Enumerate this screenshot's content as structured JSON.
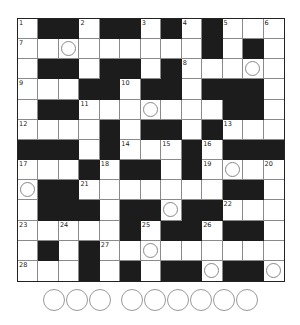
{
  "puzzle": {
    "size": {
      "rows": 13,
      "cols": 13
    },
    "grid": [
      "W#BBW#BBW#BW#BW#WW",
      "x"
    ],
    "rows": [
      "WBBWBBWBWBWWW",
      "WWWWWWWWWBWBW",
      "WBBWBBWBWWWWW",
      "WWWBBWBBWBBBW",
      "WBBWWWWWWWBBW",
      "WWWWBWBBWBWWW",
      "BBBWBWWWBWBBB",
      "WWWBWBBWBWWWW",
      "WBBWWWWWWWBBW",
      "WBBBWBBWBBWWW",
      "WWWWWBWBBWBBW",
      "WBWBWWWWWWWWW",
      "WWWBWBWBBWBBW"
    ],
    "numbers": [
      {
        "r": 0,
        "c": 0,
        "n": "1"
      },
      {
        "r": 0,
        "c": 3,
        "n": "2"
      },
      {
        "r": 0,
        "c": 6,
        "n": "3"
      },
      {
        "r": 0,
        "c": 8,
        "n": "4"
      },
      {
        "r": 0,
        "c": 10,
        "n": "5"
      },
      {
        "r": 0,
        "c": 12,
        "n": "6"
      },
      {
        "r": 1,
        "c": 0,
        "n": "7"
      },
      {
        "r": 2,
        "c": 8,
        "n": "8"
      },
      {
        "r": 3,
        "c": 0,
        "n": "9"
      },
      {
        "r": 3,
        "c": 5,
        "n": "10"
      },
      {
        "r": 4,
        "c": 3,
        "n": "11"
      },
      {
        "r": 5,
        "c": 0,
        "n": "12"
      },
      {
        "r": 5,
        "c": 10,
        "n": "13"
      },
      {
        "r": 6,
        "c": 5,
        "n": "14"
      },
      {
        "r": 6,
        "c": 7,
        "n": "15"
      },
      {
        "r": 6,
        "c": 9,
        "n": "16"
      },
      {
        "r": 7,
        "c": 0,
        "n": "17"
      },
      {
        "r": 7,
        "c": 4,
        "n": "18"
      },
      {
        "r": 7,
        "c": 9,
        "n": "19"
      },
      {
        "r": 7,
        "c": 12,
        "n": "20"
      },
      {
        "r": 8,
        "c": 3,
        "n": "21"
      },
      {
        "r": 9,
        "c": 10,
        "n": "22"
      },
      {
        "r": 10,
        "c": 0,
        "n": "23"
      },
      {
        "r": 10,
        "c": 2,
        "n": "24"
      },
      {
        "r": 10,
        "c": 6,
        "n": "25"
      },
      {
        "r": 10,
        "c": 9,
        "n": "26"
      },
      {
        "r": 11,
        "c": 4,
        "n": "27"
      },
      {
        "r": 12,
        "c": 0,
        "n": "28"
      }
    ],
    "circles": [
      {
        "r": 1,
        "c": 2
      },
      {
        "r": 2,
        "c": 11
      },
      {
        "r": 4,
        "c": 6
      },
      {
        "r": 7,
        "c": 10
      },
      {
        "r": 8,
        "c": 0
      },
      {
        "r": 9,
        "c": 7
      },
      {
        "r": 11,
        "c": 6
      },
      {
        "r": 12,
        "c": 9
      },
      {
        "r": 12,
        "c": 12
      }
    ],
    "answer_groups": [
      3,
      6
    ]
  },
  "colors": {
    "black_cell": "#1c1c1c",
    "grid_line": "#8a8a8a",
    "circle": "#888888"
  }
}
